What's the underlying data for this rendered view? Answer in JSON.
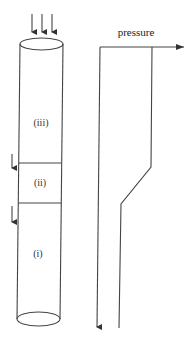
{
  "diagram": {
    "column": {
      "regions": [
        {
          "label": "(iii)",
          "position": "top"
        },
        {
          "label": "(ii)",
          "position": "middle"
        },
        {
          "label": "(i)",
          "position": "bottom"
        }
      ],
      "inflow_arrows": 3,
      "side_arrows": 2
    },
    "plot": {
      "axis_label": "pressure",
      "profile_description": "pressure constant in region (iii), decreasing across region (ii), constant in region (i)"
    },
    "colors": {
      "line": "#444444",
      "background": "#ffffff"
    }
  }
}
